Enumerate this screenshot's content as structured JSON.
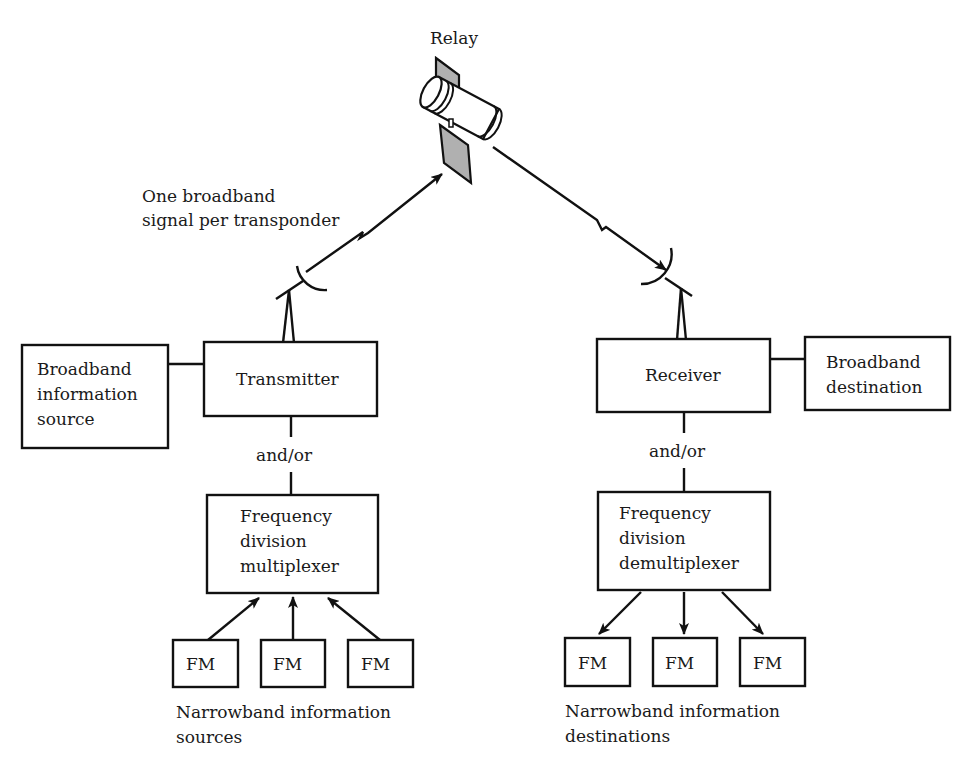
{
  "diagram": {
    "relay_label": "Relay",
    "uplink_label": [
      "One broadband",
      "signal per transponder"
    ],
    "transmit_side": {
      "broadband_source": [
        "Broadband",
        "information",
        "source"
      ],
      "transmitter": "Transmitter",
      "and_or": "and/or",
      "multiplexer": [
        "Frequency",
        "division",
        "multiplexer"
      ],
      "fm_sources": [
        "FM",
        "FM",
        "FM"
      ],
      "narrowband_caption": [
        "Narrowband information",
        "sources"
      ]
    },
    "receive_side": {
      "receiver": "Receiver",
      "broadband_destination": [
        "Broadband",
        "destination"
      ],
      "and_or": "and/or",
      "demultiplexer": [
        "Frequency",
        "division",
        "demultiplexer"
      ],
      "fm_destinations": [
        "FM",
        "FM",
        "FM"
      ],
      "narrowband_caption": [
        "Narrowband information",
        "destinations"
      ]
    },
    "colors": {
      "line": "#111111",
      "panel": "#b0b0b0",
      "background": "#ffffff"
    }
  }
}
